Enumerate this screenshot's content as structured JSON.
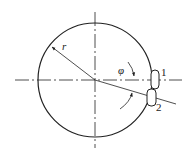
{
  "diagram": {
    "labels": {
      "radius": "r",
      "angle": "φ",
      "part1": "1",
      "part2": "2"
    },
    "colors": {
      "stroke": "#222222",
      "background": "#ffffff"
    }
  }
}
